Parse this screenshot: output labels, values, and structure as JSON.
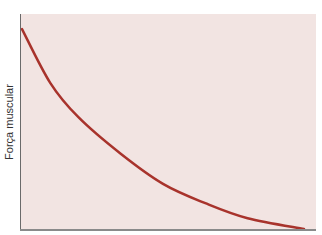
{
  "chart_data": {
    "type": "line",
    "title": "",
    "xlabel": "",
    "ylabel": "Força muscular",
    "grid": false,
    "legend": null,
    "series": [
      {
        "name": "Força muscular",
        "color": "#a8332c",
        "x": [
          0,
          0.1,
          0.2,
          0.35,
          0.5,
          0.65,
          0.8,
          1.0
        ],
        "values": [
          0.93,
          0.68,
          0.52,
          0.35,
          0.21,
          0.12,
          0.05,
          0.0
        ]
      }
    ],
    "xlim": [
      0,
      1
    ],
    "ylim": [
      0,
      1
    ],
    "background_color": "#f2e4e2"
  }
}
